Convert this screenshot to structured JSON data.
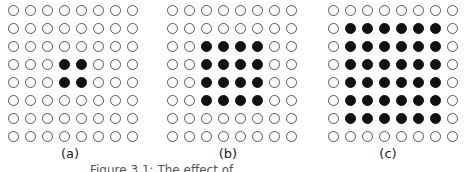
{
  "panels": [
    {
      "label": "(a)",
      "rows": 8,
      "cols": 8,
      "filled": {
        "row_start": 3,
        "row_end": 4,
        "col_start": 3,
        "col_end": 4
      }
    },
    {
      "label": "(b)",
      "rows": 8,
      "cols": 8,
      "filled": {
        "row_start": 2,
        "row_end": 5,
        "col_start": 2,
        "col_end": 5
      }
    },
    {
      "label": "(c)",
      "rows": 8,
      "cols": 8,
      "filled": {
        "row_start": 1,
        "row_end": 6,
        "col_start": 1,
        "col_end": 6
      }
    }
  ],
  "caption": "Figure 3.1: The effect of ..."
}
